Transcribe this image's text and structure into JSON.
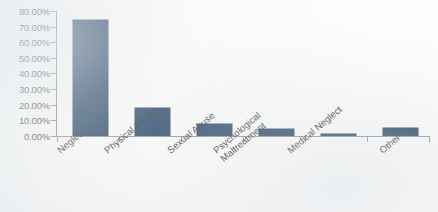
{
  "chart_data": {
    "type": "bar",
    "title": "",
    "subtitle": "",
    "xlabel": "",
    "ylabel": "",
    "categories": [
      "Neglect",
      "Physical Abuse",
      "Sexual Abuse",
      "Psychological Maltreatment",
      "Medical Neglect",
      "Other"
    ],
    "category_lines": [
      [
        "Neglect"
      ],
      [
        "Physical Abuse"
      ],
      [
        "Sexual Abuse"
      ],
      [
        "Psychological",
        "Maltreatment"
      ],
      [
        "Medical Neglect"
      ],
      [
        "Other"
      ]
    ],
    "values": [
      74.5,
      18.0,
      7.5,
      4.5,
      1.0,
      5.0
    ],
    "value_labels": [
      "74.50%",
      "18.00%",
      "7.50%",
      "4.50%",
      "1.00%",
      "5.00%"
    ],
    "ylim": [
      0,
      80
    ],
    "ytick_step": 10,
    "ytick_labels": [
      "80.00%",
      "70.00%",
      "60.00%",
      "50.00%",
      "40.00%",
      "30.00%",
      "20.00%",
      "10.00%",
      "0.00%"
    ],
    "ytick_values": [
      80,
      70,
      60,
      50,
      40,
      30,
      20,
      10,
      0
    ],
    "grid": false,
    "legend": false,
    "legend_position": "none",
    "series": [
      {
        "name": "Maltreatment Type",
        "values": [
          74.5,
          18.0,
          7.5,
          4.5,
          1.0,
          5.0
        ]
      }
    ],
    "colors": {
      "bar": "#1b3a5c",
      "axis": "#7c7c7c",
      "text": "#262626",
      "background": "#fdfdfb"
    }
  }
}
